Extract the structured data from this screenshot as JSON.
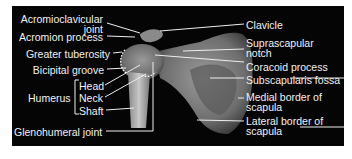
{
  "diagram": {
    "title": "",
    "background": "#050505",
    "text_color": "#f2f2f2",
    "left_labels": [
      {
        "id": "ac-joint",
        "line1": "Acromioclavicular",
        "line2": "joint"
      },
      {
        "id": "acromion",
        "text": "Acromion process"
      },
      {
        "id": "greater-tuberosity",
        "text": "Greater tuberosity"
      },
      {
        "id": "bicipital-groove",
        "text": "Bicipital groove"
      },
      {
        "id": "humerus",
        "text": "Humerus"
      },
      {
        "id": "head",
        "text": "Head"
      },
      {
        "id": "neck",
        "text": "Neck"
      },
      {
        "id": "shaft",
        "text": "Shaft"
      },
      {
        "id": "glenohumeral",
        "text": "Glenohumeral joint"
      }
    ],
    "right_labels": [
      {
        "id": "clavicle",
        "text": "Clavicle"
      },
      {
        "id": "suprascapular",
        "line1": "Suprascapular",
        "line2": "notch"
      },
      {
        "id": "coracoid",
        "text": "Coracoid process"
      },
      {
        "id": "subscapularis",
        "text": "Subscapularis fossa"
      },
      {
        "id": "medial-border",
        "line1": "Medial border of",
        "line2": "scapula"
      },
      {
        "id": "lateral-border",
        "line1": "Lateral border of",
        "line2": "scapula"
      }
    ]
  }
}
